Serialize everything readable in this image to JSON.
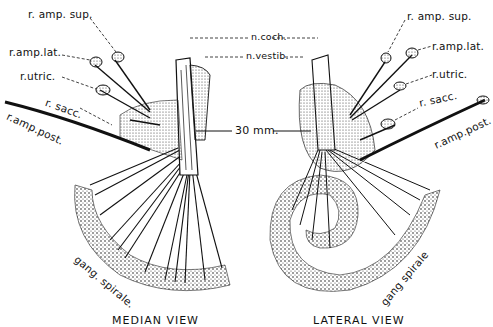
{
  "figure": {
    "scale_bar": "30 mm.",
    "center_labels": {
      "n_coch": "n.coch.",
      "n_vestib": "n.vestib."
    },
    "median_view": {
      "caption": "MEDIAN VIEW",
      "labels": {
        "r_amp_sup": "r. amp. sup.",
        "r_amp_lat": "r.amp.lat.",
        "r_utric": "r.utric.",
        "r_sacc": "r. sacc.",
        "r_amp_post": "r.amp.post.",
        "gang_spirale": "gang. spirale."
      }
    },
    "lateral_view": {
      "caption": "LATERAL VIEW",
      "labels": {
        "r_amp_sup": "r. amp. sup.",
        "r_amp_lat": "r.amp.lat.",
        "r_utric": "r.utric.",
        "r_sacc": "r. sacc.",
        "r_amp_post": "r.amp.post.",
        "gang_spirale": "gang spirale"
      }
    }
  }
}
